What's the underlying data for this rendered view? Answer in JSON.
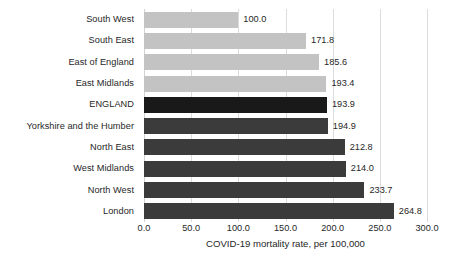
{
  "chart_data": {
    "type": "bar",
    "orientation": "horizontal",
    "title": "",
    "xlabel": "COVID-19 mortality rate, per 100,000",
    "ylabel": "",
    "xlim": [
      0,
      300
    ],
    "xtick_step": 50,
    "xticks": [
      "0.0",
      "50.0",
      "100.0",
      "150.0",
      "200.0",
      "250.0",
      "300.0"
    ],
    "xtick_values": [
      0,
      50,
      100,
      150,
      200,
      250,
      300
    ],
    "grid": "vertical",
    "legend": "none",
    "categories": [
      "South West",
      "South East",
      "East of England",
      "East Midlands",
      "ENGLAND",
      "Yorkshire and the Humber",
      "North East",
      "West Midlands",
      "North West",
      "London"
    ],
    "values": [
      100.0,
      171.8,
      185.6,
      193.4,
      193.9,
      194.9,
      212.8,
      214.0,
      233.7,
      264.8
    ],
    "value_labels": [
      "100.0",
      "171.8",
      "185.6",
      "193.4",
      "193.9",
      "194.9",
      "212.8",
      "214.0",
      "233.7",
      "264.8"
    ],
    "bar_styles": [
      "light",
      "light",
      "light",
      "light",
      "highlight",
      "dark",
      "dark",
      "dark",
      "dark",
      "dark"
    ],
    "colors": {
      "light": "#c3c3c3",
      "dark": "#3b3b3b",
      "highlight": "#191919",
      "text": "#272727",
      "gridline": "#dcdcdc",
      "background": "#ffffff"
    }
  }
}
